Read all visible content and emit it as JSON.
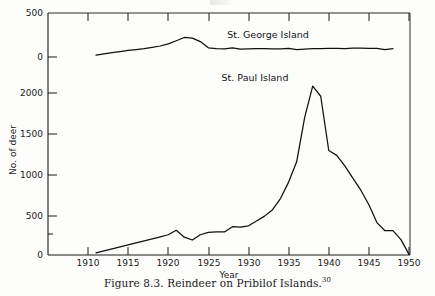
{
  "figure": {
    "caption_text": "Figure 8.3.  Reindeer on Pribilof Islands.",
    "caption_footnote": "30",
    "background_color": "#fdfdfc",
    "ink_color": "#101010"
  },
  "axes": {
    "xlabel": "Year",
    "ylabel": "No. of deer",
    "x_ticks": [
      "1910",
      "1915",
      "1920",
      "1925",
      "1930",
      "1935",
      "1940",
      "1945",
      "1950"
    ],
    "y_ticks_upper": [
      "500",
      "0"
    ],
    "y_ticks_lower": [
      "2000",
      "1500",
      "1000",
      "500",
      "0"
    ],
    "axis_break": true,
    "grid": false
  },
  "labels": {
    "st_george": "St. George Island",
    "st_paul": "St. Paul Island"
  },
  "chart_data": {
    "type": "line",
    "title": "Reindeer on Pribilof Islands",
    "xlabel": "Year",
    "ylabel": "No. of deer",
    "xlim": [
      1907,
      1951
    ],
    "grid": false,
    "legend": "inline-labels",
    "series": [
      {
        "name": "St. George Island",
        "panel": "upper",
        "ylim": [
          0,
          500
        ],
        "x": [
          1911,
          1912,
          1913,
          1914,
          1915,
          1916,
          1917,
          1918,
          1919,
          1920,
          1921,
          1922,
          1923,
          1924,
          1925,
          1926,
          1927,
          1928,
          1929,
          1930,
          1931,
          1932,
          1933,
          1934,
          1935,
          1936,
          1937,
          1938,
          1939,
          1940,
          1941,
          1942,
          1943,
          1944,
          1945,
          1946,
          1947,
          1948
        ],
        "values": [
          20,
          35,
          50,
          62,
          75,
          85,
          95,
          110,
          125,
          150,
          185,
          222,
          215,
          175,
          105,
          95,
          92,
          105,
          90,
          92,
          95,
          95,
          93,
          93,
          98,
          85,
          90,
          95,
          95,
          98,
          98,
          95,
          100,
          100,
          98,
          98,
          85,
          95
        ]
      },
      {
        "name": "St. Paul Island",
        "panel": "lower",
        "ylim": [
          0,
          2100
        ],
        "x": [
          1911,
          1912,
          1913,
          1914,
          1915,
          1916,
          1917,
          1918,
          1919,
          1920,
          1921,
          1922,
          1923,
          1924,
          1925,
          1926,
          1927,
          1928,
          1929,
          1930,
          1931,
          1932,
          1933,
          1934,
          1935,
          1936,
          1937,
          1938,
          1939,
          1940,
          1941,
          1942,
          1943,
          1944,
          1945,
          1946,
          1947,
          1948,
          1949,
          1950
        ],
        "values": [
          25,
          50,
          75,
          100,
          125,
          150,
          175,
          200,
          225,
          250,
          305,
          220,
          185,
          250,
          280,
          285,
          285,
          350,
          345,
          360,
          420,
          480,
          560,
          700,
          900,
          1150,
          1700,
          2085,
          1960,
          1290,
          1230,
          1100,
          950,
          800,
          620,
          400,
          300,
          300,
          190,
          8
        ]
      }
    ]
  }
}
